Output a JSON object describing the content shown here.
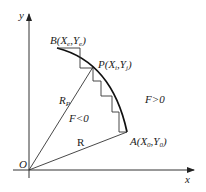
{
  "diagram": {
    "axes": {
      "x_label": "x",
      "y_label": "y",
      "origin_label": "O"
    },
    "points": {
      "B": "B(X",
      "B_sub": "e",
      "B_mid": ",Y",
      "B_sub2": "e",
      "B_end": ")",
      "P": "P(X",
      "P_sub": "i",
      "P_mid": ",Y",
      "P_sub2": "j",
      "P_end": ")",
      "A": "A(X",
      "A_sub": "0",
      "A_mid": ",Y",
      "A_sub2": "0",
      "A_end": ")"
    },
    "labels": {
      "radius_p": "R",
      "radius_p_sub": "P",
      "radius": "R",
      "region_inside": "F<0",
      "region_outside": "F>0"
    }
  }
}
